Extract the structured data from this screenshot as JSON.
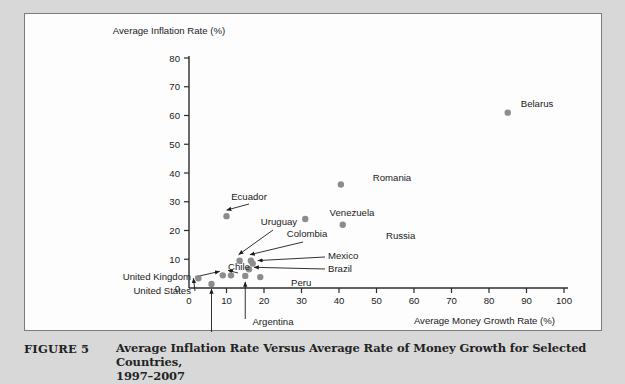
{
  "figure": {
    "label": "FIGURE 5",
    "caption_line1": "Average Inflation Rate Versus Average Rate of Money Growth for Selected Countries,",
    "caption_line2": "1997–2007"
  },
  "colors": {
    "marker": "#8c8c8c",
    "axis": "#2b2b2b",
    "panel_bg": "#fdfdfd",
    "page_bg": "#d8d8d8",
    "panel_border": "#7c7c7c",
    "text": "#1b1b1b"
  },
  "chart_data": {
    "type": "scatter",
    "title": "",
    "xlabel": "Average Money Growth Rate (%)",
    "ylabel": "Average Inflation Rate (%)",
    "xlim": [
      0,
      100
    ],
    "ylim": [
      0,
      80
    ],
    "xticks": [
      0,
      10,
      20,
      30,
      40,
      50,
      60,
      70,
      80,
      90,
      100
    ],
    "yticks": [
      0,
      10,
      20,
      30,
      40,
      50,
      60,
      70,
      80
    ],
    "xtick_labels": [
      "0",
      "10",
      "20",
      "30",
      "40",
      "50",
      "60",
      "70",
      "80",
      "90",
      "100"
    ],
    "ytick_labels": [
      "0",
      "10",
      "20",
      "30",
      "40",
      "50",
      "60",
      "70",
      "80"
    ],
    "grid": false,
    "legend": false,
    "points": [
      {
        "name": "Belarus",
        "x": 85,
        "y": 61
      },
      {
        "name": "Romania",
        "x": 40.5,
        "y": 36
      },
      {
        "name": "Venezuela",
        "x": 31,
        "y": 24
      },
      {
        "name": "Russia",
        "x": 41,
        "y": 22
      },
      {
        "name": "Ecuador",
        "x": 10,
        "y": 25
      },
      {
        "name": "Uruguay",
        "x": 13.5,
        "y": 9.5
      },
      {
        "name": "Colombia",
        "x": 16.5,
        "y": 9.5
      },
      {
        "name": "Mexico",
        "x": 17,
        "y": 8.5
      },
      {
        "name": "Brazil",
        "x": 16,
        "y": 6.5
      },
      {
        "name": "Peru",
        "x": 19,
        "y": 3.8
      },
      {
        "name": "Argentina",
        "x": 15,
        "y": 4.2
      },
      {
        "name": "Chile",
        "x": 11.2,
        "y": 4.4
      },
      {
        "name": "United Kingdom",
        "x": 9,
        "y": 4.4
      },
      {
        "name": "United States",
        "x": 2.5,
        "y": 3.4
      },
      {
        "name": "Switzerland",
        "x": 6,
        "y": 1.4
      }
    ],
    "labels": [
      {
        "text": "Belarus",
        "x": 512,
        "y": 93,
        "anchor": "middle"
      },
      {
        "text": "Romania",
        "x": 367,
        "y": 167,
        "anchor": "middle"
      },
      {
        "text": "Venezuela",
        "x": 327,
        "y": 202,
        "anchor": "middle"
      },
      {
        "text": "Russia",
        "x": 361,
        "y": 225,
        "anchor": "start"
      },
      {
        "text": "Ecuador",
        "x": 224,
        "y": 186,
        "anchor": "middle"
      },
      {
        "text": "Uruguay",
        "x": 254,
        "y": 211,
        "anchor": "middle"
      },
      {
        "text": "Colombia",
        "x": 282,
        "y": 223,
        "anchor": "middle"
      },
      {
        "text": "Mexico",
        "x": 303,
        "y": 245,
        "anchor": "start"
      },
      {
        "text": "Brazil",
        "x": 303,
        "y": 258,
        "anchor": "start"
      },
      {
        "text": "Peru",
        "x": 266,
        "y": 272,
        "anchor": "start"
      },
      {
        "text": "Chile",
        "x": 203,
        "y": 256,
        "anchor": "start"
      },
      {
        "text": "United Kingdom",
        "x": 166,
        "y": 266,
        "anchor": "end"
      },
      {
        "text": "United States",
        "x": 166,
        "y": 280,
        "anchor": "end"
      },
      {
        "text": "Argentina",
        "x": 248,
        "y": 311,
        "anchor": "middle"
      },
      {
        "text": "Switzerland",
        "x": 222,
        "y": 326,
        "anchor": "middle"
      }
    ]
  }
}
